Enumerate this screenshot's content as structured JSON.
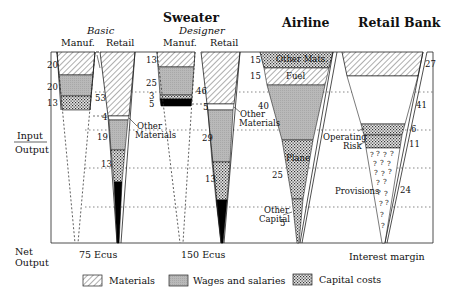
{
  "left_labels": {
    "input": "Input",
    "output": "Output",
    "net": "Net",
    "net_output": "Output"
  },
  "titles": {
    "sweater": "Sweater",
    "basic": "Basic",
    "designer": "Designer",
    "manuf": "Manuf.",
    "retail": "Retail",
    "airline": "Airline",
    "bank": "Retail Bank"
  },
  "basic_manuf": {
    "materials": "20",
    "wages": "20",
    "capital": "13"
  },
  "basic_retail": {
    "materials": "53",
    "other_mats": "4",
    "wages": "19",
    "capital": "13"
  },
  "designer_manuf": {
    "materials": "13",
    "wages": "25",
    "other": "3",
    "black": "5"
  },
  "designer_retail": {
    "materials": "46",
    "other_mats": "5",
    "wages": "29",
    "capital": "13"
  },
  "other_materials_label": [
    "Other",
    "Materials"
  ],
  "airline": {
    "other_mats": "15",
    "fuel": "15",
    "wages": "40",
    "plane": "25",
    "other_capital": "5",
    "other_mats_label": "Other Mats.",
    "fuel_label": "Fuel",
    "plane_label": "Plane",
    "other_capital_label": [
      "Other",
      "Capital"
    ]
  },
  "bank": {
    "materials": "27",
    "wages": "41",
    "op_risk_a": "6",
    "op_risk_b": "11",
    "provisions": "24",
    "op_label": [
      "Operating",
      "Risk"
    ],
    "provisions_label": "Provisions"
  },
  "net_outputs": {
    "basic": "75 Ecus",
    "designer": "150 Ecus",
    "bank": "Interest margin"
  },
  "legend": {
    "materials": "Materials",
    "wages": "Wages and salaries",
    "capital": "Capital costs"
  }
}
